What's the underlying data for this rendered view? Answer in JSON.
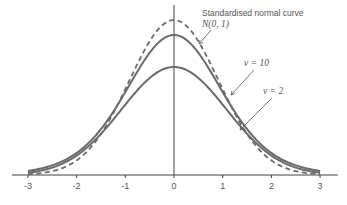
{
  "chart_data": {
    "type": "line",
    "title": "",
    "xlabel": "",
    "ylabel": "",
    "xlim": [
      -3.2,
      3.2
    ],
    "x_ticks": [
      -3,
      -2,
      -1,
      0,
      1,
      2,
      3
    ],
    "x_tick_labels": [
      "-3",
      "-2",
      "-1",
      "0",
      "1",
      "2",
      "3"
    ],
    "grid": false,
    "legend": "none (inline annotations)",
    "series": [
      {
        "name": "Standardised normal curve N(0, 1)",
        "style": "dashed",
        "peak_density": 0.399
      },
      {
        "name": "t distribution, v = 10",
        "style": "solid",
        "peak_density": 0.389
      },
      {
        "name": "t distribution, v = 2",
        "style": "solid",
        "peak_density": 0.354
      }
    ],
    "annotations": [
      {
        "text": "Standardised normal curve",
        "line2": "N(0, 1)",
        "points_to": "dashed curve near x=0.5"
      },
      {
        "text": "v = 10",
        "points_to": "v=10 curve near x=1.1"
      },
      {
        "text": "v = 2",
        "points_to": "v=2 curve near x=1.3"
      }
    ]
  },
  "labels": {
    "normal_line1": "Standardised normal curve",
    "normal_line2": "N(0, 1)",
    "nu10": "v = 10",
    "nu2": "v = 2"
  },
  "colors": {
    "curve": "#6a6a6a",
    "axis": "#444444",
    "text": "#555555"
  }
}
